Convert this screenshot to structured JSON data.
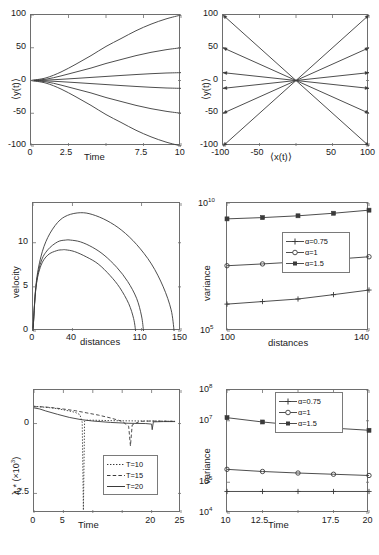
{
  "figure": {
    "title": "",
    "background": "#ffffff",
    "line_color": "#3a3a3a",
    "axis_color": "#6e6e6e"
  },
  "chart_data": [
    {
      "id": "panel-a",
      "position": "top-left",
      "type": "line",
      "title": "",
      "xlabel": "Time",
      "ylabel": "⟨y(t)⟩",
      "xlim": [
        0,
        10
      ],
      "ylim": [
        -100,
        100
      ],
      "xticks": [
        0,
        2.5,
        5,
        7.5,
        10
      ],
      "xticklabels": [
        "0",
        "2.5",
        "",
        "7.5",
        "10"
      ],
      "yticks": [
        -100,
        -50,
        0,
        50,
        100
      ],
      "yticklabels": [
        "-100",
        "-50",
        "0",
        "50",
        "100"
      ],
      "grid": false,
      "legend": null,
      "x": [
        0,
        1,
        2,
        3,
        4,
        5,
        6,
        7,
        8,
        9,
        10
      ],
      "series": [
        {
          "name": "fan+3",
          "values": [
            0,
            4,
            13,
            25,
            38,
            52,
            64,
            76,
            86,
            94,
            100
          ]
        },
        {
          "name": "fan+2",
          "values": [
            0,
            2,
            7,
            13,
            19,
            26,
            32,
            38,
            43,
            47,
            50
          ]
        },
        {
          "name": "fan+1",
          "values": [
            0,
            0.6,
            1.8,
            3.2,
            4.7,
            6.2,
            7.7,
            9.1,
            10.4,
            11.4,
            12
          ]
        },
        {
          "name": "fan-1",
          "values": [
            0,
            -0.6,
            -1.8,
            -3.2,
            -4.7,
            -6.2,
            -7.7,
            -9.1,
            -10.4,
            -11.4,
            -12
          ]
        },
        {
          "name": "fan-2",
          "values": [
            0,
            -2,
            -7,
            -13,
            -19,
            -26,
            -32,
            -38,
            -43,
            -47,
            -50
          ]
        },
        {
          "name": "fan-3",
          "values": [
            0,
            -4,
            -13,
            -25,
            -38,
            -52,
            -64,
            -76,
            -86,
            -94,
            -100
          ]
        }
      ]
    },
    {
      "id": "panel-b",
      "position": "top-right",
      "type": "line",
      "title": "",
      "xlabel": "⟨x(t)⟩",
      "ylabel": "⟨y(t)⟩",
      "xlim": [
        -100,
        100
      ],
      "ylim": [
        -100,
        100
      ],
      "xticks": [
        -100,
        -50,
        0,
        50,
        100
      ],
      "xticklabels": [
        "-100",
        "-50",
        "",
        "50",
        "100"
      ],
      "yticks": [
        -100,
        -50,
        0,
        50,
        100
      ],
      "yticklabels": [
        "-100",
        "-50",
        "0",
        "50",
        "100"
      ],
      "grid": false,
      "legend": null,
      "rays": [
        {
          "name": "ray-1",
          "x_end": 100,
          "y_end": 100
        },
        {
          "name": "ray-2",
          "x_end": 100,
          "y_end": 50
        },
        {
          "name": "ray-3",
          "x_end": 100,
          "y_end": 12
        },
        {
          "name": "ray-4",
          "x_end": 100,
          "y_end": -12
        },
        {
          "name": "ray-5",
          "x_end": 100,
          "y_end": -50
        },
        {
          "name": "ray-6",
          "x_end": 100,
          "y_end": -100
        },
        {
          "name": "ray-7",
          "x_end": -100,
          "y_end": 100
        },
        {
          "name": "ray-8",
          "x_end": -100,
          "y_end": 50
        },
        {
          "name": "ray-9",
          "x_end": -100,
          "y_end": 12
        },
        {
          "name": "ray-10",
          "x_end": -100,
          "y_end": -12
        },
        {
          "name": "ray-11",
          "x_end": -100,
          "y_end": -50
        },
        {
          "name": "ray-12",
          "x_end": -100,
          "y_end": -100
        }
      ]
    },
    {
      "id": "panel-c",
      "position": "middle-left",
      "type": "line",
      "title": "",
      "xlabel": "distances",
      "ylabel": "velocity",
      "xlim": [
        0,
        150
      ],
      "ylim": [
        0,
        14.5
      ],
      "xticks": [
        0,
        40,
        110,
        150
      ],
      "xticklabels": [
        "0",
        "40",
        "110",
        "150"
      ],
      "yticks": [
        0,
        5,
        10
      ],
      "yticklabels": [
        "0",
        "5",
        "10"
      ],
      "grid": false,
      "legend": null,
      "series": [
        {
          "name": "curve-long",
          "peak_x": 48,
          "peak_y": 13.4,
          "x_end": 143,
          "x": [
            0,
            3,
            8,
            15,
            25,
            35,
            48,
            60,
            75,
            90,
            105,
            120,
            132,
            140,
            143
          ],
          "values": [
            0,
            5.2,
            8.4,
            10.6,
            12.3,
            13.1,
            13.4,
            13.2,
            12.5,
            11.4,
            9.8,
            7.6,
            5.0,
            2.4,
            0
          ]
        },
        {
          "name": "curve-mid",
          "peak_x": 38,
          "peak_y": 10.3,
          "x_end": 112,
          "x": [
            0,
            3,
            8,
            15,
            25,
            33,
            38,
            48,
            60,
            72,
            85,
            96,
            105,
            110,
            112
          ],
          "values": [
            0,
            5.0,
            7.8,
            9.2,
            10.1,
            10.3,
            10.3,
            10.1,
            9.5,
            8.6,
            7.2,
            5.6,
            3.7,
            1.7,
            0
          ]
        },
        {
          "name": "curve-short",
          "peak_x": 33,
          "peak_y": 9.2,
          "x_end": 104,
          "x": [
            0,
            3,
            8,
            15,
            24,
            30,
            33,
            42,
            54,
            66,
            78,
            88,
            97,
            102,
            104
          ],
          "values": [
            0,
            4.9,
            7.4,
            8.6,
            9.1,
            9.2,
            9.2,
            9.0,
            8.4,
            7.6,
            6.3,
            4.9,
            3.1,
            1.4,
            0
          ]
        }
      ]
    },
    {
      "id": "panel-d",
      "position": "middle-right",
      "type": "line",
      "title": "",
      "xlabel": "distances",
      "ylabel": "variance",
      "xlim": [
        100,
        140
      ],
      "ylim_log": [
        5,
        10
      ],
      "xticks": [
        100,
        140
      ],
      "xticklabels": [
        "100",
        "140"
      ],
      "yticklabels": [
        "10",
        "10"
      ],
      "ytick_exponents": [
        "5",
        "10"
      ],
      "yscale": "log",
      "grid": false,
      "legend": {
        "position": "center",
        "entries": [
          {
            "label": "α=0.75",
            "marker": "plus"
          },
          {
            "label": "α=1",
            "marker": "circle"
          },
          {
            "label": "α=1.5",
            "marker": "square"
          }
        ]
      },
      "x": [
        100,
        110,
        120,
        130,
        140
      ],
      "series": [
        {
          "name": "α=0.75",
          "marker": "plus",
          "values_log10": [
            6.05,
            6.15,
            6.25,
            6.42,
            6.6
          ]
        },
        {
          "name": "α=1",
          "marker": "circle",
          "values_log10": [
            7.55,
            7.62,
            7.7,
            7.8,
            7.9
          ]
        },
        {
          "name": "α=1.5",
          "marker": "square",
          "values_log10": [
            9.38,
            9.43,
            9.5,
            9.6,
            9.72
          ]
        }
      ]
    },
    {
      "id": "panel-e",
      "position": "bottom-left",
      "type": "line",
      "title": "",
      "xlabel": "Time",
      "ylabel": "λₓ* (×10³)",
      "xlim": [
        0,
        25
      ],
      "ylim": [
        -3.2,
        1.2
      ],
      "xticks": [
        0,
        5,
        10,
        15,
        20,
        25
      ],
      "xticklabels": [
        "0",
        "5",
        "",
        "",
        "20",
        "25"
      ],
      "yticks": [
        -2.5,
        0
      ],
      "yticklabels": [
        "-2.5",
        "0"
      ],
      "grid": false,
      "legend": {
        "position": "lower-right",
        "entries": [
          {
            "label": "T=10",
            "style": "dotted"
          },
          {
            "label": "T=15",
            "style": "dashed"
          },
          {
            "label": "T=20",
            "style": "solid"
          }
        ]
      },
      "series": [
        {
          "name": "T=10",
          "style": "dotted",
          "spike_x": 8.4,
          "spike_y": -3.1,
          "x": [
            0,
            1,
            2,
            3,
            4,
            5,
            6,
            7,
            7.8,
            8.2,
            8.4,
            8.6,
            9,
            10,
            14,
            20,
            24
          ],
          "values": [
            0.62,
            0.6,
            0.58,
            0.56,
            0.53,
            0.49,
            0.45,
            0.4,
            0.32,
            0.05,
            -3.1,
            0.08,
            0.12,
            0.12,
            0.1,
            0.09,
            0.08
          ]
        },
        {
          "name": "T=15",
          "style": "dashed",
          "spike_x": 16.4,
          "spike_y": -0.8,
          "x": [
            0,
            1,
            2,
            3,
            5,
            7,
            9,
            11,
            13,
            15,
            16.1,
            16.4,
            16.7,
            18,
            20,
            24
          ],
          "values": [
            0.6,
            0.6,
            0.59,
            0.57,
            0.52,
            0.46,
            0.38,
            0.3,
            0.2,
            0.08,
            -0.1,
            -0.8,
            -0.05,
            0.08,
            0.09,
            0.08
          ]
        },
        {
          "name": "T=20",
          "style": "solid",
          "spike_x": 20.1,
          "spike_y": -0.22,
          "x": [
            0,
            1,
            2,
            4,
            6,
            8,
            10,
            13,
            16,
            19,
            20,
            20.1,
            20.3,
            22,
            24
          ],
          "values": [
            0.56,
            0.52,
            0.45,
            0.33,
            0.22,
            0.14,
            0.09,
            0.04,
            0.01,
            0.0,
            -0.02,
            -0.22,
            0.06,
            0.07,
            0.07
          ]
        }
      ]
    },
    {
      "id": "panel-f",
      "position": "bottom-right",
      "type": "line",
      "title": "",
      "xlabel": "Time",
      "ylabel": "variance",
      "xlim": [
        10,
        20
      ],
      "ylim_log": [
        4,
        8
      ],
      "xticks": [
        10,
        12.5,
        15,
        17.5,
        20
      ],
      "xticklabels": [
        "10",
        "12.5",
        "",
        "17.5",
        "20"
      ],
      "ytick_exponents": [
        "4",
        "5",
        "7",
        "8"
      ],
      "yscale": "log",
      "grid": false,
      "legend": {
        "position": "upper-right",
        "entries": [
          {
            "label": "α=0.75",
            "marker": "plus"
          },
          {
            "label": "α=1",
            "marker": "circle"
          },
          {
            "label": "α=1.5",
            "marker": "square"
          }
        ]
      },
      "x": [
        10,
        12.5,
        15,
        17.5,
        20
      ],
      "series": [
        {
          "name": "α=0.75",
          "marker": "plus",
          "values_log10": [
            4.7,
            4.7,
            4.7,
            4.7,
            4.7
          ]
        },
        {
          "name": "α=1",
          "marker": "circle",
          "values_log10": [
            5.42,
            5.35,
            5.3,
            5.26,
            5.22
          ]
        },
        {
          "name": "α=1.5",
          "marker": "square",
          "values_log10": [
            7.1,
            6.96,
            6.85,
            6.76,
            6.69
          ]
        }
      ]
    }
  ]
}
